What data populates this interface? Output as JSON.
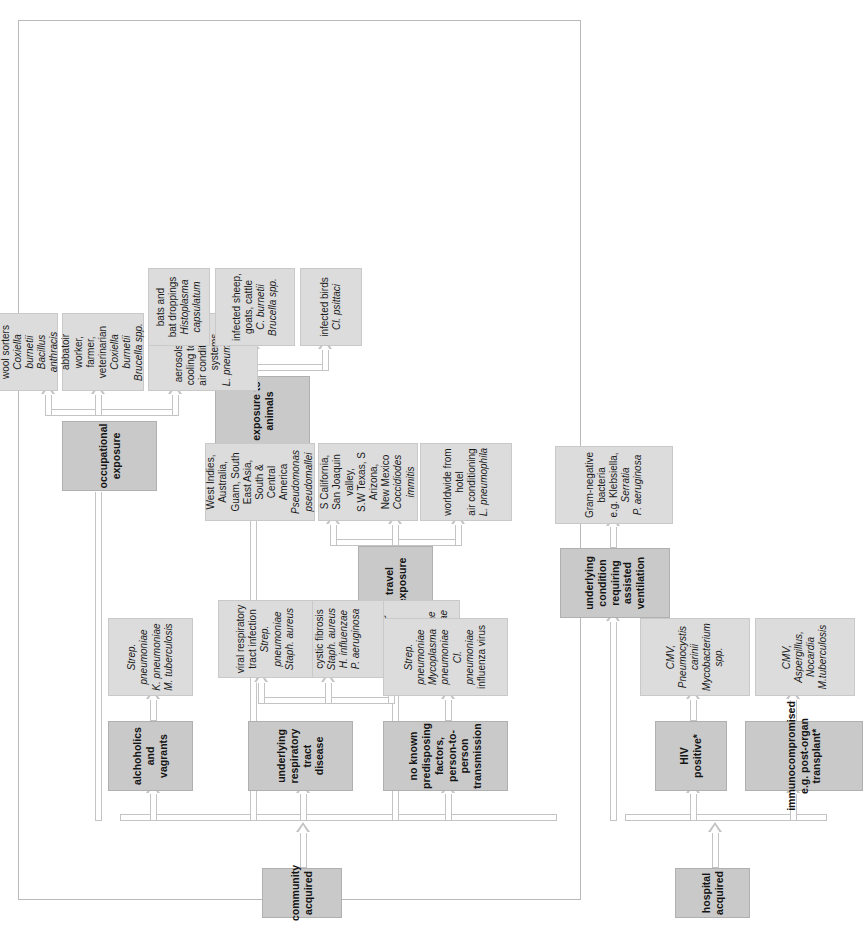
{
  "figure": {
    "caption": "",
    "kind": "flowchart",
    "orientation": "rotated-90-ccw"
  },
  "roots": {
    "community": "community acquired",
    "hospital": "hospital acquired"
  },
  "categories": {
    "alcoholics": "alchoholics and vagrants",
    "underlying_resp": "underlying respiratory\ntract disease",
    "no_known": "no known predisposing\nfactors, person-to-person\ntransmission",
    "travel": "travel exposure",
    "occupational": "occupational exposure",
    "animals": "exposure to animals",
    "hiv": "HIV positive*",
    "immuno": "immunocompromised\ne.g. post-organ transplant*",
    "ventilation": "underlying condition\nrequiring assisted\nventilation"
  },
  "organisms": {
    "alcoholics_org": [
      {
        "text": "Strep. pneumoniae",
        "italic": true
      },
      {
        "text": "K. pneumoniae",
        "italic": true
      },
      {
        "text": "M. tuberculosis",
        "italic": true
      }
    ],
    "copd_org": [
      {
        "text": "chronic obstructive",
        "italic": false
      },
      {
        "text": "airways disease",
        "italic": false
      },
      {
        "text": "Strep. pneumoniae",
        "italic": true
      },
      {
        "text": "H. influenzae",
        "italic": true
      }
    ],
    "cf_org": [
      {
        "text": "cystic fibrosis",
        "italic": false
      },
      {
        "text": "Staph. aureus",
        "italic": true
      },
      {
        "text": "H. influenzae",
        "italic": true
      },
      {
        "text": "P. aeruginosa",
        "italic": true
      }
    ],
    "viral_org": [
      {
        "text": "viral respiratory",
        "italic": false
      },
      {
        "text": "tract infection",
        "italic": false
      },
      {
        "text": "Strep. pneumoniae",
        "italic": true
      },
      {
        "text": "Staph. aureus",
        "italic": true
      }
    ],
    "no_known_org": [
      {
        "text": "Strep. pneumoniae",
        "italic": true
      },
      {
        "text": "Mycoplasma pneumoniae",
        "italic": true
      },
      {
        "text": "Cl. pneumoniae",
        "italic": true
      },
      {
        "text": "influenza virus",
        "italic": false
      }
    ],
    "hotel_org": [
      {
        "text": "worldwide from hotel",
        "italic": false
      },
      {
        "text": "air conditioning",
        "italic": false
      },
      {
        "text": "L. pneumophila",
        "italic": true
      }
    ],
    "cocci_org": [
      {
        "text": "S California,",
        "italic": false
      },
      {
        "text": "San Joaquin valley,",
        "italic": false
      },
      {
        "text": "S.W Texas, S Arizona,",
        "italic": false
      },
      {
        "text": "New Mexico",
        "italic": false
      },
      {
        "text": "Coccidiodes immitis",
        "italic": true
      }
    ],
    "pseudomallei_org": [
      {
        "text": "West Indies, Australia,",
        "italic": false
      },
      {
        "text": "Guam, South East Asia,",
        "italic": false
      },
      {
        "text": "South & Central America",
        "italic": false
      },
      {
        "text": "Pseudomonas",
        "italic": true
      },
      {
        "text": "pseudomallei",
        "italic": true
      }
    ],
    "aerosols_org": [
      {
        "text": "aerosols from",
        "italic": false
      },
      {
        "text": "cooling towers,",
        "italic": false
      },
      {
        "text": "air conditioning",
        "italic": false
      },
      {
        "text": "systems",
        "italic": false
      },
      {
        "text": "L. pneumophila",
        "italic": true
      }
    ],
    "abbatoir_org": [
      {
        "text": "abbatoir worker,",
        "italic": false
      },
      {
        "text": "farmer, veterinarian",
        "italic": false
      },
      {
        "text": "Coxiella burnetii",
        "italic": true
      },
      {
        "text": "Brucella spp.",
        "italic": true
      }
    ],
    "hide_org": [
      {
        "text": "animal hide",
        "italic": false
      },
      {
        "text": "importers,",
        "italic": false
      },
      {
        "text": "wool sorters",
        "italic": false
      },
      {
        "text": "Coxiella burnetii",
        "italic": true
      },
      {
        "text": "Bacillus anthracis",
        "italic": true
      }
    ],
    "birds_org": [
      {
        "text": "infected birds",
        "italic": false
      },
      {
        "text": "Cl. psittaci",
        "italic": true
      }
    ],
    "sheep_org": [
      {
        "text": "infected sheep,",
        "italic": false
      },
      {
        "text": "goats, cattle",
        "italic": false
      },
      {
        "text": "C. burnetii",
        "italic": true
      },
      {
        "text": "Brucella spp.",
        "italic": true
      }
    ],
    "bats_org": [
      {
        "text": "bats and",
        "italic": false
      },
      {
        "text": "bat droppings",
        "italic": false
      },
      {
        "text": "Histoplasma",
        "italic": true
      },
      {
        "text": "capsulatum",
        "italic": true
      }
    ],
    "hiv_org": [
      {
        "text": "CMV, Pneumocystis carinii",
        "italic": true
      },
      {
        "text": "Mycobacterium spp.",
        "italic": true
      }
    ],
    "immuno_org": [
      {
        "text": "CMV, Aspergillus,",
        "italic": true
      },
      {
        "text": "Nocardia",
        "italic": true
      },
      {
        "text": "M.tuberculosis",
        "italic": true
      }
    ],
    "vent_org": [
      {
        "text": "Gram-negative  bacteria",
        "italic": false
      },
      {
        "text": "e.g. Klebsiella,",
        "italic": false
      },
      {
        "text": "Serratia",
        "italic": true
      },
      {
        "text": "P. aeruginosa",
        "italic": true
      }
    ]
  },
  "colors": {
    "category_fill": "#c9c9c9",
    "organism_fill": "#dcdcdc",
    "connector": "#c4c4c4",
    "frame": "#b9b9b9"
  }
}
